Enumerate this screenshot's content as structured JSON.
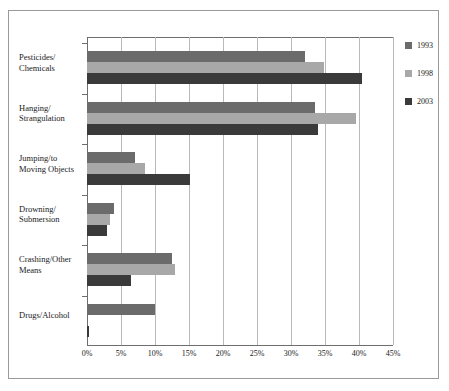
{
  "chart_data": {
    "type": "bar",
    "orientation": "horizontal",
    "title": "",
    "xlabel": "",
    "ylabel": "",
    "xlim": [
      0,
      45
    ],
    "xtick_labels": [
      "0%",
      "5%",
      "10%",
      "15%",
      "20%",
      "25%",
      "30%",
      "35%",
      "40%",
      "45%"
    ],
    "xtick_values": [
      0,
      5,
      10,
      15,
      20,
      25,
      30,
      35,
      40,
      45
    ],
    "grid": true,
    "legend_position": "right",
    "categories": [
      "Pesticides/\nChemicals",
      "Hanging/\nStrangulation",
      "Jumping/to\nMoving Objects",
      "Drowning/\nSubmersion",
      "Crashing/Other\nMeans",
      "Drugs/Alcohol"
    ],
    "series": [
      {
        "name": "1993",
        "color": "#6b6b6b",
        "values": [
          32.0,
          33.5,
          7.0,
          4.0,
          12.5,
          10.0
        ]
      },
      {
        "name": "1998",
        "color": "#a8a8a8",
        "values": [
          34.8,
          39.5,
          8.5,
          3.4,
          13.0,
          0.0
        ]
      },
      {
        "name": "2003",
        "color": "#3a3a3a",
        "values": [
          40.4,
          34.0,
          15.2,
          3.0,
          6.5,
          0.3
        ]
      }
    ]
  },
  "categories": [
    {
      "line1": "Pesticides/",
      "line2": "Chemicals"
    },
    {
      "line1": "Hanging/",
      "line2": "Strangulation"
    },
    {
      "line1": "Jumping/to",
      "line2": "Moving Objects"
    },
    {
      "line1": "Drowning/",
      "line2": "Submersion"
    },
    {
      "line1": "Crashing/Other",
      "line2": "Means"
    },
    {
      "line1": "Drugs/Alcohol",
      "line2": ""
    }
  ],
  "legend": {
    "items": [
      {
        "label": "1993",
        "color": "#6b6b6b"
      },
      {
        "label": "1998",
        "color": "#a8a8a8"
      },
      {
        "label": "2003",
        "color": "#3a3a3a"
      }
    ]
  },
  "axis": {
    "ticks": [
      "0%",
      "5%",
      "10%",
      "15%",
      "20%",
      "25%",
      "30%",
      "35%",
      "40%",
      "45%"
    ]
  }
}
